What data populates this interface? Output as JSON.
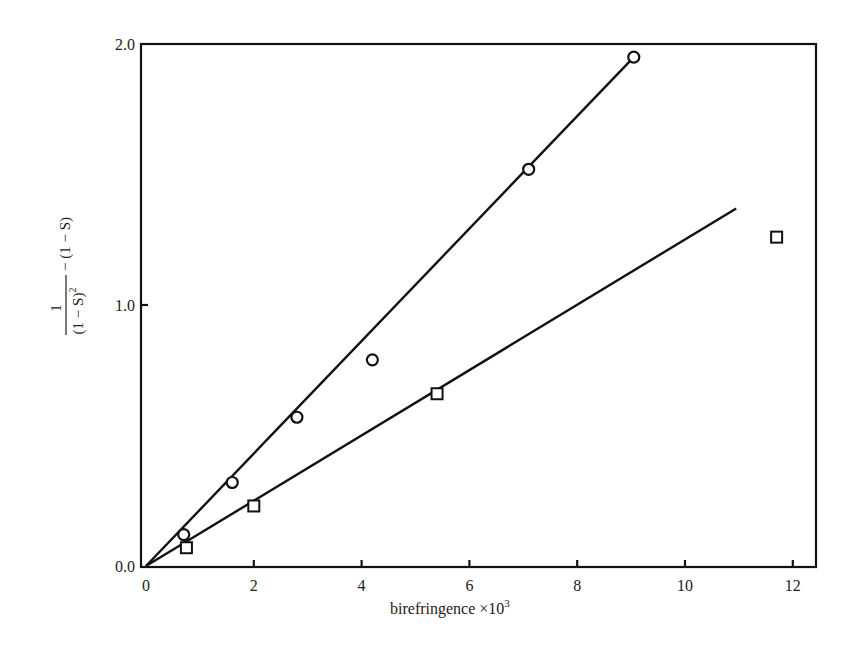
{
  "chart_data": {
    "type": "scatter",
    "title": "",
    "xlabel": "birefringence ×10³",
    "xlabel_parts": {
      "text": "birefringence ×10",
      "sup": "3"
    },
    "ylabel": "1/(1−S)² − (1−S)",
    "ylabel_parts": {
      "numerator": "1",
      "denominator": "(1 − S)",
      "den_sup": "2",
      "rest": "− (1 − S)"
    },
    "xlim": [
      0,
      12.5
    ],
    "ylim": [
      0,
      2.0
    ],
    "x_ticks": [
      0,
      2,
      4,
      6,
      8,
      10,
      12
    ],
    "x_tick_labels": [
      "0",
      "2",
      "4",
      "6",
      "8",
      "10",
      "12"
    ],
    "y_ticks": [
      0.0,
      1.0,
      2.0
    ],
    "y_tick_labels": [
      "0.0",
      "1.0",
      "2.0"
    ],
    "grid": false,
    "legend": null,
    "series": [
      {
        "name": "circles",
        "marker": "circle",
        "x": [
          0.7,
          1.6,
          2.8,
          4.2,
          7.1,
          9.05
        ],
        "y": [
          0.12,
          0.32,
          0.57,
          0.79,
          1.52,
          1.95
        ],
        "fit_line": {
          "x": [
            0,
            9.05
          ],
          "y": [
            0,
            1.95
          ]
        }
      },
      {
        "name": "squares",
        "marker": "square",
        "x": [
          0.75,
          2.0,
          5.4,
          11.7
        ],
        "y": [
          0.07,
          0.23,
          0.66,
          1.26
        ],
        "fit_line": {
          "x": [
            0,
            10.95
          ],
          "y": [
            0,
            1.37
          ]
        }
      }
    ]
  }
}
